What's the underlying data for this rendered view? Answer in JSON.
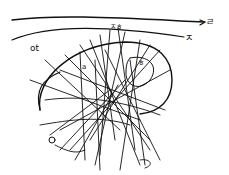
{
  "image": {
    "description": "Hand-drawn ink sketch of a dense tangle of lines over a curved oval shape with two long curved arrows at the top",
    "ink_color": "#111111",
    "background_color": "#ffffff"
  },
  "labels": {
    "top_arrow_label": "ㄹ",
    "second_arrow_label": "ㅈ",
    "left_label": "ot",
    "top_center_label": "ㅈㅎ",
    "inner_left_label": "a",
    "inner_right_label": "ㅎ",
    "bottom_left_label": "ㅇ"
  }
}
